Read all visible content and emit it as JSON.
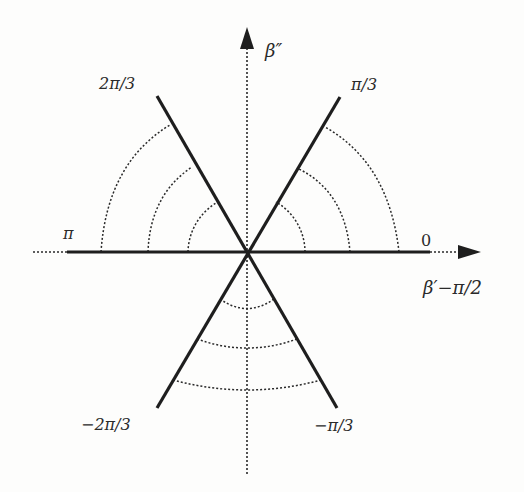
{
  "diagram": {
    "type": "angular-sector-diagram",
    "center": {
      "x": 247,
      "y": 252
    },
    "axes": {
      "horizontal": {
        "label": "β′−π/2",
        "arrow": "right"
      },
      "vertical": {
        "label": "β″",
        "arrow": "up"
      }
    },
    "rays": [
      {
        "angle_label": "0",
        "angle_deg": 0
      },
      {
        "angle_label": "π/3",
        "angle_deg": 60
      },
      {
        "angle_label": "2π/3",
        "angle_deg": 120
      },
      {
        "angle_label": "π",
        "angle_deg": 180
      },
      {
        "angle_label": "−2π/3",
        "angle_deg": -120
      },
      {
        "angle_label": "−π/3",
        "angle_deg": -60
      }
    ],
    "sectors": [
      {
        "name": "right-sector",
        "between": [
          "0",
          "π/3"
        ],
        "contour_count": 3
      },
      {
        "name": "left-sector",
        "between": [
          "2π/3",
          "π"
        ],
        "contour_count": 3
      },
      {
        "name": "bottom-sector",
        "between": [
          "−2π/3",
          "−π/3"
        ],
        "contour_count": 3
      }
    ],
    "colors": {
      "line": "#1e1e1e",
      "dotted": "#2a2a2a",
      "background": "#fdfdfc"
    }
  },
  "labels": {
    "beta_double_prime": "β″",
    "beta_prime_minus_pi_half": "β′−π/2",
    "zero": "0",
    "pi": "π",
    "pi_over_3": "π/3",
    "two_pi_over_3": "2π/3",
    "minus_pi_over_3": "−π/3",
    "minus_two_pi_over_3": "−2π/3"
  }
}
